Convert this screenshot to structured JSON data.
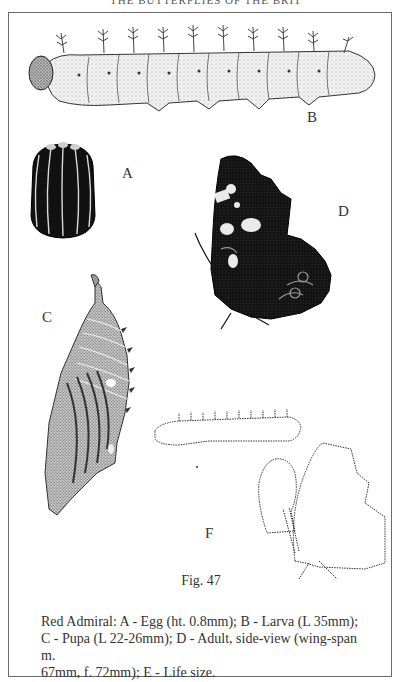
{
  "running_head": "THE BUTTERFLIES OF THE BRITISH ISLES",
  "figure": {
    "number_label": "Fig. 47",
    "labels": {
      "A": "A",
      "B": "B",
      "C": "C",
      "D": "D",
      "F": "F"
    },
    "panels": [
      {
        "id": "A",
        "subject": "egg",
        "style": "black ribbed ovoid"
      },
      {
        "id": "B",
        "subject": "larva",
        "style": "stippled spiny caterpillar"
      },
      {
        "id": "C",
        "subject": "pupa",
        "style": "stippled hanging chrysalis"
      },
      {
        "id": "D",
        "subject": "adult side-view",
        "style": "dark butterfly wing underside"
      },
      {
        "id": "F",
        "subject": "life-size outlines",
        "style": "dotted outlines of larva, pupa, adult"
      }
    ]
  },
  "caption": {
    "line1": "Red Admiral:  A - Egg (ht. 0.8mm);  B - Larva (L 35mm);",
    "line2": "C - Pupa (L 22-26mm);  D - Adult, side-view (wing-span m.",
    "line3": "67mm, f. 72mm); E - Life size."
  },
  "colors": {
    "frame": "#6a6a6a",
    "ink": "#1a1a1a",
    "paper": "#ffffff"
  }
}
